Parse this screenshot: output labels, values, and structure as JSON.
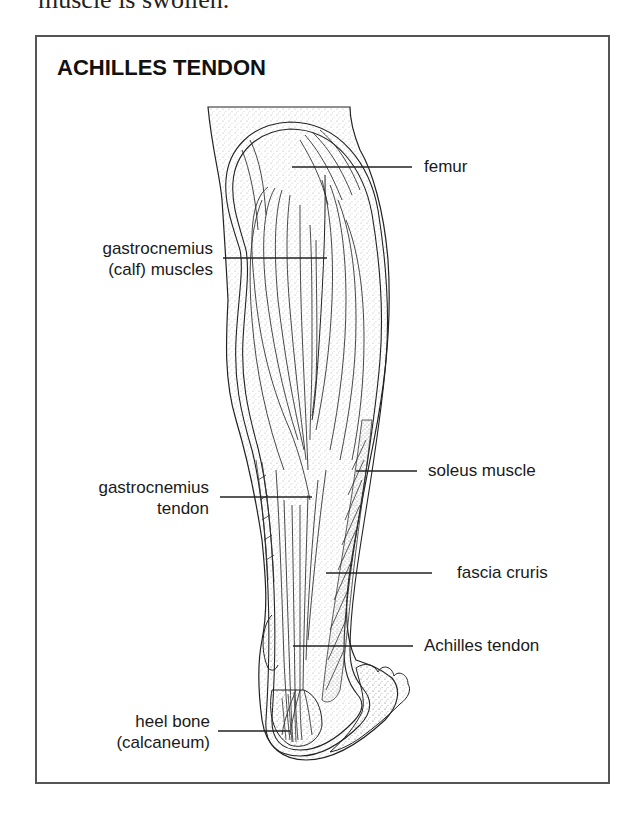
{
  "context": {
    "preceding_text": "muscle is swollen."
  },
  "figure": {
    "title": "ACHILLES TENDON",
    "labels": {
      "femur": {
        "lines": [
          "femur"
        ],
        "side": "right"
      },
      "gastrocnemius_muscles": {
        "lines": [
          "gastrocnemius",
          "(calf) muscles"
        ],
        "side": "left"
      },
      "soleus": {
        "lines": [
          "soleus muscle"
        ],
        "side": "right"
      },
      "gastrocnemius_tendon": {
        "lines": [
          "gastrocnemius",
          "tendon"
        ],
        "side": "left"
      },
      "fascia_cruris": {
        "lines": [
          "fascia cruris"
        ],
        "side": "right"
      },
      "achilles_tendon": {
        "lines": [
          "Achilles tendon"
        ],
        "side": "right"
      },
      "heel_bone": {
        "lines": [
          "heel bone",
          "(calcaneum)"
        ],
        "side": "left"
      }
    },
    "colors": {
      "frame": "#555555",
      "line": "#222222",
      "stipple": "#9a9a9a"
    }
  }
}
